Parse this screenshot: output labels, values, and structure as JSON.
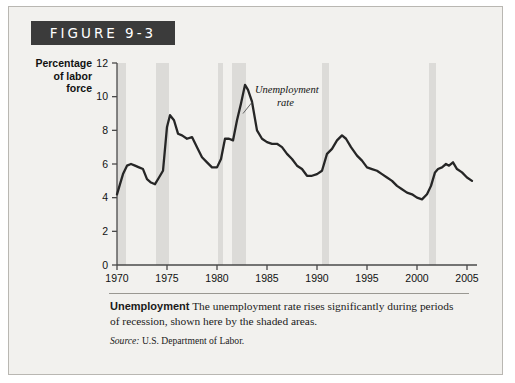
{
  "figure": {
    "banner_label": "FIGURE 9-3",
    "caption_title": "Unemployment",
    "caption_body": "The unemployment rate rises significantly during periods of recession, shown here by the shaded areas.",
    "source_prefix": "Source:",
    "source_text": "U.S. Department of Labor."
  },
  "colors": {
    "banner_bg": "#3b3b3b",
    "card_bg": "#f2f1ee",
    "line": "#262626",
    "recession_band": "#dcdbd8",
    "axis": "#4a4a4a"
  },
  "chart_data": {
    "type": "line",
    "title": "",
    "xlabel": "Year",
    "ylabel": "Percentage of labor force",
    "ylabel_lines": [
      "Percentage",
      "of labor",
      "force"
    ],
    "xlim": [
      1970,
      2006
    ],
    "ylim": [
      0,
      12
    ],
    "ytick_values": [
      0,
      2,
      4,
      6,
      8,
      10,
      12
    ],
    "ytick_labels": [
      "0",
      "2",
      "4",
      "6",
      "8",
      "10",
      "12"
    ],
    "xtick_values": [
      1970,
      1975,
      1980,
      1985,
      1990,
      1995,
      2000,
      2005
    ],
    "xtick_labels": [
      "1970",
      "1975",
      "1980",
      "1985",
      "1990",
      "1995",
      "2000",
      "2005"
    ],
    "grid": false,
    "legend": false,
    "annotations": [
      {
        "text_lines": [
          "Unemployment",
          "rate"
        ],
        "x": 1983.8,
        "y": 10.2,
        "points_to_x": 1982.6,
        "points_to_y": 9.0
      }
    ],
    "recession_bands": [
      {
        "label": "1969-70 recession",
        "start": 1970.0,
        "end": 1970.9
      },
      {
        "label": "1973-75 recession",
        "start": 1973.9,
        "end": 1975.2
      },
      {
        "label": "1980 recession",
        "start": 1980.1,
        "end": 1980.6
      },
      {
        "label": "1981-82 recession",
        "start": 1981.5,
        "end": 1982.9
      },
      {
        "label": "1990-91 recession",
        "start": 1990.5,
        "end": 1991.2
      },
      {
        "label": "2001 recession",
        "start": 2001.2,
        "end": 2001.9
      }
    ],
    "series": [
      {
        "name": "Unemployment rate",
        "x": [
          1970.0,
          1970.3,
          1970.6,
          1971.0,
          1971.4,
          1971.8,
          1972.2,
          1972.6,
          1973.0,
          1973.4,
          1973.8,
          1974.2,
          1974.6,
          1975.0,
          1975.3,
          1975.7,
          1976.1,
          1976.5,
          1977.0,
          1977.5,
          1978.0,
          1978.5,
          1979.0,
          1979.5,
          1980.0,
          1980.4,
          1980.8,
          1981.2,
          1981.6,
          1982.0,
          1982.4,
          1982.8,
          1983.1,
          1983.5,
          1984.0,
          1984.5,
          1985.0,
          1985.5,
          1986.0,
          1986.5,
          1987.0,
          1987.5,
          1988.0,
          1988.5,
          1989.0,
          1989.5,
          1990.0,
          1990.5,
          1991.0,
          1991.5,
          1992.0,
          1992.5,
          1992.9,
          1993.4,
          1994.0,
          1994.5,
          1995.0,
          1995.5,
          1996.0,
          1996.5,
          1997.0,
          1997.5,
          1998.0,
          1998.5,
          1999.0,
          1999.5,
          2000.0,
          2000.5,
          2001.0,
          2001.4,
          2001.8,
          2002.1,
          2002.5,
          2002.9,
          2003.2,
          2003.6,
          2004.0,
          2004.5,
          2005.0,
          2005.5
        ],
        "y": [
          4.2,
          4.8,
          5.4,
          5.9,
          6.0,
          5.9,
          5.8,
          5.7,
          5.1,
          4.9,
          4.8,
          5.2,
          5.6,
          8.2,
          8.9,
          8.6,
          7.8,
          7.7,
          7.5,
          7.6,
          7.0,
          6.4,
          6.1,
          5.8,
          5.8,
          6.3,
          7.5,
          7.5,
          7.4,
          8.6,
          9.6,
          10.7,
          10.4,
          9.7,
          8.0,
          7.5,
          7.3,
          7.2,
          7.2,
          7.0,
          6.6,
          6.3,
          5.9,
          5.7,
          5.3,
          5.3,
          5.4,
          5.6,
          6.6,
          6.9,
          7.4,
          7.7,
          7.5,
          7.0,
          6.5,
          6.2,
          5.8,
          5.7,
          5.6,
          5.4,
          5.2,
          5.0,
          4.7,
          4.5,
          4.3,
          4.2,
          4.0,
          3.9,
          4.2,
          4.7,
          5.5,
          5.7,
          5.8,
          6.0,
          5.9,
          6.1,
          5.7,
          5.5,
          5.2,
          5.0
        ]
      }
    ]
  }
}
